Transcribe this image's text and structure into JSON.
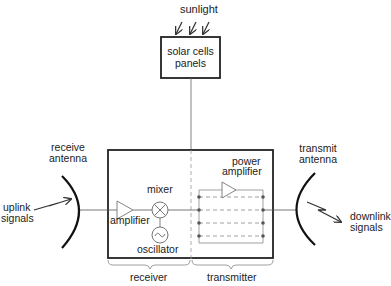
{
  "diagram": {
    "labels": {
      "sunlight": "sunlight",
      "solar_panel_line1": "solar cells",
      "solar_panel_line2": "panels",
      "receive_antenna_line1": "receive",
      "receive_antenna_line2": "antenna",
      "uplink_line1": "uplink",
      "uplink_line2": "signals",
      "amplifier": "amplifier",
      "mixer": "mixer",
      "oscillator": "oscillator",
      "power_amplifier_line1": "power",
      "power_amplifier_line2": "amplifier",
      "transmit_antenna_line1": "transmit",
      "transmit_antenna_line2": "antenna",
      "downlink_line1": "downlink",
      "downlink_line2": "signals",
      "receiver": "receiver",
      "transmitter": "transmitter"
    },
    "nodes": [
      {
        "id": "solar-panels",
        "label": "solar cells panels"
      },
      {
        "id": "receive-antenna",
        "label": "receive antenna"
      },
      {
        "id": "amplifier",
        "label": "amplifier"
      },
      {
        "id": "mixer",
        "label": "mixer"
      },
      {
        "id": "oscillator",
        "label": "oscillator"
      },
      {
        "id": "power-amplifier",
        "label": "power amplifier"
      },
      {
        "id": "transmit-antenna",
        "label": "transmit antenna"
      }
    ],
    "edges": [
      {
        "from": "sunlight",
        "to": "solar-panels"
      },
      {
        "from": "solar-panels",
        "to": "main-unit"
      },
      {
        "from": "uplink signals",
        "to": "receive-antenna"
      },
      {
        "from": "receive-antenna",
        "to": "amplifier"
      },
      {
        "from": "amplifier",
        "to": "mixer"
      },
      {
        "from": "oscillator",
        "to": "mixer"
      },
      {
        "from": "mixer",
        "to": "power-amplifier"
      },
      {
        "from": "power-amplifier",
        "to": "transmit-antenna"
      },
      {
        "from": "transmit-antenna",
        "to": "downlink signals"
      }
    ],
    "groups": [
      {
        "id": "receiver",
        "label": "receiver"
      },
      {
        "id": "transmitter",
        "label": "transmitter"
      }
    ]
  }
}
